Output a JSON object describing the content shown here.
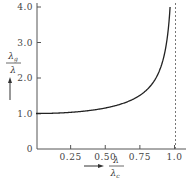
{
  "chart_data": {
    "type": "line",
    "title": "",
    "xlabel": "λ / λc",
    "ylabel": "λg / λ",
    "xlabel_num": "λ",
    "xlabel_den": "λ",
    "xlabel_den_sub": "c",
    "ylabel_num": "λ",
    "ylabel_num_sub": "g",
    "ylabel_den": "λ",
    "xlim": [
      0,
      1.05
    ],
    "ylim": [
      0,
      4.0
    ],
    "x_ticks": [
      0.25,
      0.5,
      0.75,
      1.0
    ],
    "x_tick_labels": [
      "0.25",
      "0.50",
      "0.75",
      "1.0"
    ],
    "y_ticks": [
      0,
      1.0,
      2.0,
      3.0,
      4.0
    ],
    "y_tick_labels": [
      "0",
      "1.0",
      "2.0",
      "3.0",
      "4.0"
    ],
    "grid": false,
    "legend": null,
    "asymptote": {
      "x": 1.0,
      "style": "dashed"
    },
    "series": [
      {
        "name": "λg/λ = 1/√(1−(λ/λc)²)",
        "x": [
          0.0,
          0.1,
          0.2,
          0.3,
          0.4,
          0.5,
          0.6,
          0.7,
          0.75,
          0.8,
          0.85,
          0.9,
          0.93,
          0.95,
          0.96,
          0.97
        ],
        "values": [
          1.0,
          1.005,
          1.021,
          1.048,
          1.091,
          1.155,
          1.25,
          1.4,
          1.512,
          1.667,
          1.898,
          2.294,
          2.72,
          3.2,
          3.57,
          4.0
        ]
      }
    ]
  }
}
